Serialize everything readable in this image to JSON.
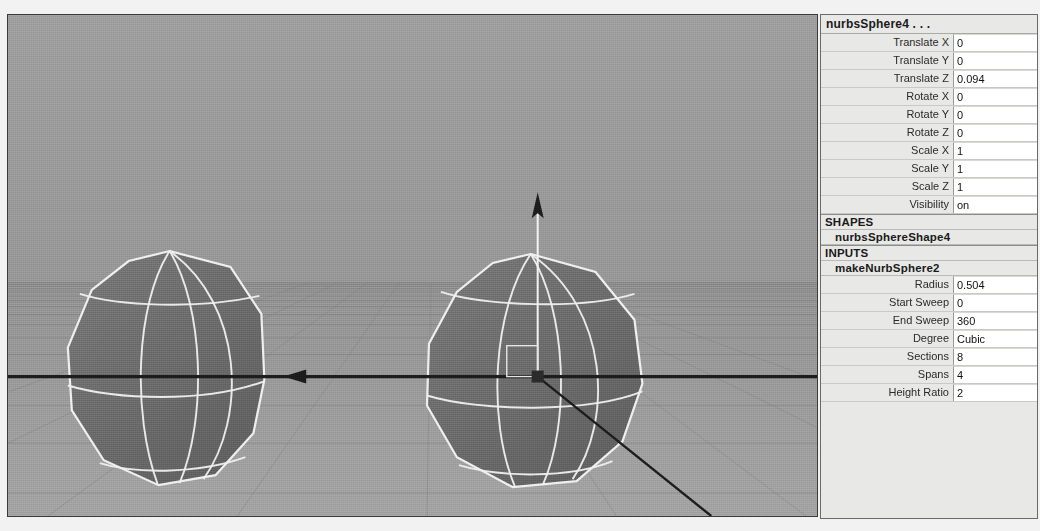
{
  "viewport": {
    "name": "perspective-viewport",
    "background_color": "#9a9a9a",
    "grid_color": "#7d7d7d",
    "wireframe_color": "#f2f2f2",
    "object_fill_color": "#6e6e6e",
    "manipulator_color": "#1a1a1a",
    "objects": [
      {
        "name": "nurbsSphere3",
        "label": "left-sphere"
      },
      {
        "name": "nurbsSphere4",
        "label": "right-sphere-selected"
      }
    ],
    "manipulator": {
      "type": "move-manipulator",
      "axes": [
        "y-axis-arrow-up",
        "x-axis-arrow-right",
        "z-axis-line"
      ],
      "center_handle": "pivot-square"
    }
  },
  "channel_box": {
    "title": "nurbsSphere4 . . .",
    "transform_attributes": [
      {
        "label": "Translate X",
        "value": "0"
      },
      {
        "label": "Translate Y",
        "value": "0"
      },
      {
        "label": "Translate Z",
        "value": "0.094"
      },
      {
        "label": "Rotate X",
        "value": "0"
      },
      {
        "label": "Rotate Y",
        "value": "0"
      },
      {
        "label": "Rotate Z",
        "value": "0"
      },
      {
        "label": "Scale X",
        "value": "1"
      },
      {
        "label": "Scale Y",
        "value": "1"
      },
      {
        "label": "Scale Z",
        "value": "1"
      },
      {
        "label": "Visibility",
        "value": "on"
      }
    ],
    "shapes_header": "SHAPES",
    "shape_node": "nurbsSphereShape4",
    "inputs_header": "INPUTS",
    "input_node": "makeNurbSphere2",
    "input_attributes": [
      {
        "label": "Radius",
        "value": "0.504"
      },
      {
        "label": "Start Sweep",
        "value": "0"
      },
      {
        "label": "End Sweep",
        "value": "360"
      },
      {
        "label": "Degree",
        "value": "Cubic"
      },
      {
        "label": "Sections",
        "value": "8"
      },
      {
        "label": "Spans",
        "value": "4"
      },
      {
        "label": "Height Ratio",
        "value": "2"
      }
    ]
  }
}
